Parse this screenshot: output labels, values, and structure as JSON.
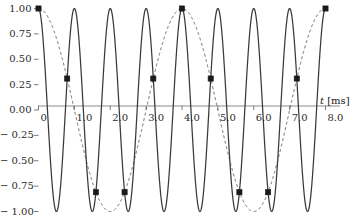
{
  "chart_data": {
    "type": "line",
    "title": "",
    "xlabel": "t [ms]",
    "ylabel": "",
    "xlim": [
      0,
      8
    ],
    "ylim": [
      -1,
      1
    ],
    "grid": false,
    "legend": "none",
    "x_ticks": [
      "0",
      "1.0",
      "2.0",
      "3.0",
      "4.0",
      "5.0",
      "6.0",
      "7.0",
      "8.0"
    ],
    "x_tick_values": [
      0,
      1,
      2,
      3,
      4,
      5,
      6,
      7,
      8
    ],
    "y_ticks": [
      "1.00",
      "0.75",
      "0.50",
      "0.25",
      "0.00",
      "− 0.25",
      "− 0.50",
      "− 0.75",
      "− 1.00"
    ],
    "y_tick_values": [
      1.0,
      0.75,
      0.5,
      0.25,
      0.0,
      -0.25,
      -0.5,
      -0.75,
      -1.0
    ],
    "series": [
      {
        "name": "carrier",
        "style": "solid",
        "color": "#3a3a3a",
        "period_ms": 1.0,
        "amplitude": 1.0,
        "phase_deg": 0,
        "formula": "cos(2*pi*t/1.0)"
      },
      {
        "name": "envelope",
        "style": "dashed",
        "color": "#555555",
        "period_ms": 4.0,
        "amplitude": 1.0,
        "phase_deg": 0,
        "formula": "cos(2*pi*t/4.0)"
      }
    ],
    "markers": {
      "name": "sample-points",
      "shape": "square",
      "color": "#1a1a1a",
      "spacing_ms": 0.8,
      "x": [
        0.0,
        0.8,
        1.6,
        2.4,
        3.2,
        4.0,
        4.8,
        5.6,
        6.4,
        7.2,
        8.0
      ],
      "y": [
        1.0,
        0.31,
        -0.81,
        -0.81,
        0.31,
        1.0,
        0.31,
        -0.81,
        -0.81,
        0.31,
        1.0
      ]
    },
    "axis_colors": {
      "zero_axis": "#8c8c8c",
      "tick": "#7a7a7a",
      "curve_solid": "#3a3a3a",
      "curve_dashed": "#555555"
    }
  }
}
